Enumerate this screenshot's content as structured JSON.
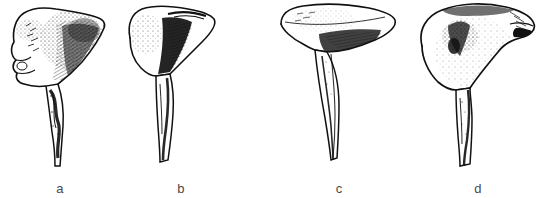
{
  "plate": {
    "kind": "anatomical-line-drawing-plate",
    "background_color": "#ffffff",
    "ink_color": "#111111",
    "label_color": "#4a4a4a",
    "subject": "scapula",
    "view": "lateral",
    "specimen_count": 4,
    "figures": [
      {
        "id": "a",
        "label": "a",
        "description": "Scapula with knobbed, lobed cranial border and narrow twisted shaft",
        "blade_outline": "irregular, strongly notched along the upper-left margin with rounded tubercles",
        "shading": "dense stipple and cross-hatch across the blade centre, dark spiral band down the shaft",
        "shaft": "slender, slightly sinuous, dark stripe spiralling down its length"
      },
      {
        "id": "b",
        "label": "b",
        "description": "Scapula with smooth rounded blade and a broad dark band beside the shaft",
        "blade_outline": "rounded lobe with a gently arching upper border",
        "shading": "light stipple over the blade, heavy solid black wedge along the medial shaft edge",
        "shaft": "long, straight, tapering to a slim distal end"
      },
      {
        "id": "c",
        "label": "c",
        "description": "Scapula with wide flattened fan-shaped blade and long fine shaft",
        "blade_outline": "broad, flat, wing-like fan with a shallow notch on the left",
        "shading": "fine stipple over the blade with dark hatching at the blade-shaft junction",
        "shaft": "very long and narrow, tapering to a fine point"
      },
      {
        "id": "d",
        "label": "d",
        "description": "Scapula with broad rounded blade and dense stippled shading",
        "blade_outline": "wide, dome-like blade with a pointed lateral spur to the right",
        "shading": "heavy stipple cloud over the centre of the blade, dark solid spur at the right margin",
        "shaft": "short, stout, straight shaft with a dark medial line"
      }
    ]
  }
}
